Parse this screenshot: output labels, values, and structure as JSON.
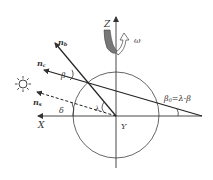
{
  "diagram": {
    "type": "geometry",
    "labels": {
      "z_axis": "Z",
      "x_axis": "X",
      "y_axis": "Y",
      "omega": "ω",
      "n_b": "n",
      "n_b_sub": "b",
      "n_c": "n",
      "n_c_sub": "c",
      "n_s": "n",
      "n_s_sub": "s",
      "beta": "β",
      "delta": "δ",
      "lambda": "λ",
      "beta0_formula": "β",
      "beta0_sub": "0",
      "beta0_rhs": "=λ-β"
    },
    "icons": {
      "sun": "sun-icon",
      "rotation": "rotation-arrow-icon"
    },
    "colors": {
      "line": "#333333",
      "circle": "#555555",
      "rotation_fill": "#777777"
    }
  }
}
